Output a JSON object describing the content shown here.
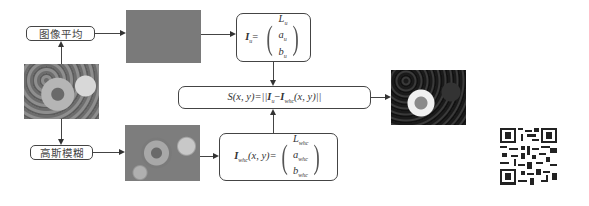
{
  "labels": {
    "average": "图像平均",
    "gaussian": "高斯模糊"
  },
  "equations": {
    "mean": {
      "lhs_symbol": "I",
      "lhs_sub": "u",
      "lhs_eq": "=",
      "vector": [
        {
          "sym": "L",
          "sub": "u"
        },
        {
          "sym": "a",
          "sub": "u"
        },
        {
          "sym": "b",
          "sub": "u"
        }
      ]
    },
    "saliency": {
      "prefix": "S(x, y)=||",
      "i1": "I",
      "i1_sub": "u",
      "minus": "−",
      "i2": "I",
      "i2_sub": "whc",
      "suffix": "(x, y)||"
    },
    "blurred": {
      "lhs_symbol": "I",
      "lhs_sub": "whc",
      "lhs_args": "(x, y)=",
      "vector": [
        {
          "sym": "L",
          "sub": "whc"
        },
        {
          "sym": "a",
          "sub": "whc"
        },
        {
          "sym": "b",
          "sub": "whc"
        }
      ]
    }
  },
  "images": {
    "input": "input-image",
    "mean_color": "mean-color-image",
    "blurred": "blurred-image",
    "saliency_map": "saliency-map-image",
    "qr": "qr-code"
  },
  "colors": {
    "mean_gray": "#7a7a7a",
    "line": "#444444"
  }
}
